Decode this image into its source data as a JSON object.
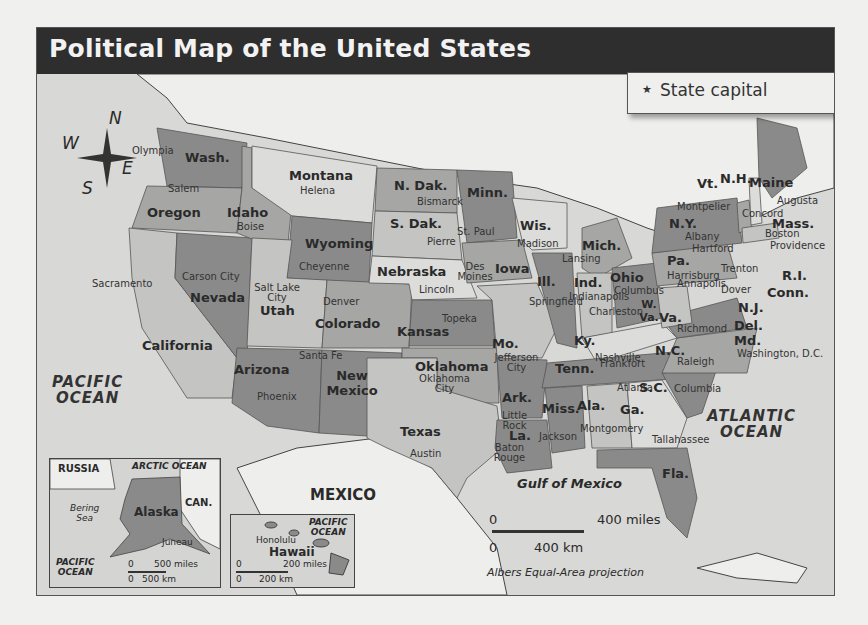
{
  "title": "Political Map of the United States",
  "legend": {
    "symbol": "★",
    "label": "State capital"
  },
  "compass": {
    "n": "N",
    "s": "S",
    "e": "E",
    "w": "W"
  },
  "states": [
    {
      "name": "Wash.",
      "capital": "Olympia"
    },
    {
      "name": "Oregon",
      "capital": "Salem"
    },
    {
      "name": "California",
      "capital": "Sacramento"
    },
    {
      "name": "Nevada",
      "capital": "Carson City"
    },
    {
      "name": "Idaho",
      "capital": "Boise"
    },
    {
      "name": "Montana",
      "capital": "Helena"
    },
    {
      "name": "Wyoming",
      "capital": "Cheyenne"
    },
    {
      "name": "Utah",
      "capital": "Salt Lake City"
    },
    {
      "name": "Colorado",
      "capital": "Denver"
    },
    {
      "name": "Arizona",
      "capital": "Phoenix"
    },
    {
      "name": "New Mexico",
      "capital": "Santa Fe"
    },
    {
      "name": "N. Dak.",
      "capital": "Bismarck"
    },
    {
      "name": "S. Dak.",
      "capital": "Pierre"
    },
    {
      "name": "Nebraska",
      "capital": "Lincoln"
    },
    {
      "name": "Kansas",
      "capital": "Topeka"
    },
    {
      "name": "Oklahoma",
      "capital": "Oklahoma City"
    },
    {
      "name": "Texas",
      "capital": "Austin"
    },
    {
      "name": "Minn.",
      "capital": "St. Paul"
    },
    {
      "name": "Iowa",
      "capital": "Des Moines"
    },
    {
      "name": "Mo.",
      "capital": "Jefferson City"
    },
    {
      "name": "Ark.",
      "capital": "Little Rock"
    },
    {
      "name": "La.",
      "capital": "Baton Rouge"
    },
    {
      "name": "Wis.",
      "capital": "Madison"
    },
    {
      "name": "Ill.",
      "capital": "Springfield"
    },
    {
      "name": "Mich.",
      "capital": "Lansing"
    },
    {
      "name": "Ind.",
      "capital": "Indianapolis"
    },
    {
      "name": "Ohio",
      "capital": "Columbus"
    },
    {
      "name": "Ky.",
      "capital": "Frankfort"
    },
    {
      "name": "Tenn.",
      "capital": "Nashville"
    },
    {
      "name": "Miss.",
      "capital": "Jackson"
    },
    {
      "name": "Ala.",
      "capital": "Montgomery"
    },
    {
      "name": "Ga.",
      "capital": "Atlanta"
    },
    {
      "name": "Fla.",
      "capital": "Tallahassee"
    },
    {
      "name": "S.C.",
      "capital": "Columbia"
    },
    {
      "name": "N.C.",
      "capital": "Raleigh"
    },
    {
      "name": "Va.",
      "capital": "Richmond"
    },
    {
      "name": "W. Va.",
      "capital": "Charleston"
    },
    {
      "name": "Md.",
      "capital": "Annapolis"
    },
    {
      "name": "Del.",
      "capital": "Dover"
    },
    {
      "name": "N.J.",
      "capital": "Trenton"
    },
    {
      "name": "Pa.",
      "capital": "Harrisburg"
    },
    {
      "name": "N.Y.",
      "capital": "Albany"
    },
    {
      "name": "Conn.",
      "capital": "Hartford"
    },
    {
      "name": "R.I.",
      "capital": "Providence"
    },
    {
      "name": "Mass.",
      "capital": "Boston"
    },
    {
      "name": "Vt.",
      "capital": "Montpelier"
    },
    {
      "name": "N.H.",
      "capital": "Concord"
    },
    {
      "name": "Maine",
      "capital": "Augusta"
    },
    {
      "name": "Alaska",
      "capital": "Juneau"
    },
    {
      "name": "Hawaii",
      "capital": "Honolulu"
    }
  ],
  "federal_district": "Washington, D.C.",
  "water": {
    "pacific": [
      "PACIFIC",
      "OCEAN"
    ],
    "atlantic": [
      "ATLANTIC",
      "OCEAN"
    ],
    "gulf": "Gulf of Mexico",
    "arctic": "ARCTIC OCEAN",
    "bering": [
      "Bering",
      "Sea"
    ]
  },
  "countries": {
    "mexico": "MEXICO",
    "russia": "RUSSIA",
    "canada": "CAN."
  },
  "scale": {
    "miles": "400 miles",
    "km": "400 km",
    "zero": "0",
    "projection": "Albers Equal-Area projection"
  },
  "alaska_inset": {
    "miles": "500 miles",
    "km": "500 km",
    "zero": "0",
    "ocean": [
      "PACIFIC",
      "OCEAN"
    ]
  },
  "hawaii_inset": {
    "miles": "200 miles",
    "km": "200 km",
    "zero": "0",
    "ocean": [
      "PACIFIC",
      "OCEAN"
    ]
  },
  "colors": {
    "title_bg": "#2e2e2e",
    "title_fg": "#f2f2f2",
    "water": "#d8d8d6",
    "land_foreign": "#eeeeec",
    "state_dark": "#8a8a8a",
    "state_mid": "#a6a6a4",
    "state_light": "#c4c4c2",
    "state_pale": "#dcdcda"
  }
}
